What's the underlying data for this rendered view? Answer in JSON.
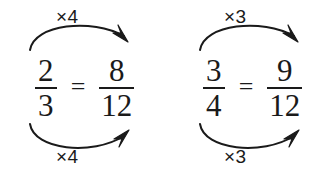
{
  "diagram": {
    "ink_color": "#1a1a1a",
    "background_color": "#ffffff",
    "groups": [
      {
        "id": "left",
        "equals_sign": "=",
        "source_fraction": {
          "numerator": "2",
          "denominator": "3"
        },
        "result_fraction": {
          "numerator": "8",
          "denominator": "12"
        },
        "top_arrow": {
          "label": "×4",
          "direction": "left-to-right",
          "curve": "arc-above",
          "from": "numerator",
          "to": "numerator"
        },
        "bottom_arrow": {
          "label": "×4",
          "direction": "left-to-right",
          "curve": "arc-below",
          "from": "denominator",
          "to": "denominator"
        }
      },
      {
        "id": "right",
        "equals_sign": "=",
        "source_fraction": {
          "numerator": "3",
          "denominator": "4"
        },
        "result_fraction": {
          "numerator": "9",
          "denominator": "12"
        },
        "top_arrow": {
          "label": "×3",
          "direction": "left-to-right",
          "curve": "arc-above",
          "from": "numerator",
          "to": "numerator"
        },
        "bottom_arrow": {
          "label": "×3",
          "direction": "left-to-right",
          "curve": "arc-below",
          "from": "denominator",
          "to": "denominator"
        }
      }
    ]
  }
}
